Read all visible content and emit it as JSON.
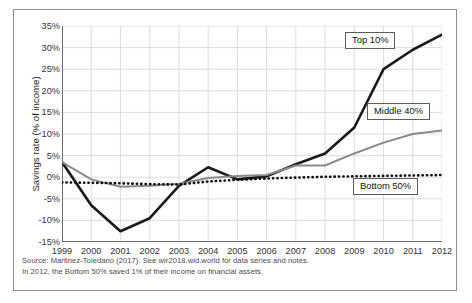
{
  "figure": {
    "frame_color": "#8d9096",
    "background": "#ffffff"
  },
  "notes": [
    "Source: Martinez-Toledano (2017). See wir2018.wid.world for data series and notes.",
    "In 2012, the Bottom 50% saved 1% of their income on financial assets."
  ],
  "callouts": {
    "top": "Top 10%",
    "middle": "Middle 40%",
    "bottom": "Bottom 50%"
  },
  "chart_data": {
    "type": "line",
    "title": "",
    "xlabel": "",
    "ylabel": "Savings rate (% of income)",
    "x": [
      1999,
      2000,
      2001,
      2002,
      2003,
      2004,
      2005,
      2006,
      2007,
      2008,
      2009,
      2010,
      2011,
      2012
    ],
    "xtick_labels": [
      "1999",
      "2000",
      "2001",
      "2002",
      "2003",
      "2004",
      "2005",
      "2006",
      "2007",
      "2008",
      "2009",
      "2010",
      "2011",
      "2012"
    ],
    "ylim": [
      -15,
      35
    ],
    "ytick_values": [
      35,
      30,
      25,
      20,
      15,
      10,
      5,
      0,
      -5,
      -10,
      -15
    ],
    "ytick_labels": [
      "35%",
      "30%",
      "25%",
      "20%",
      "15%",
      "10%",
      "5%",
      "0%",
      "-5%",
      "-10%",
      "-15%"
    ],
    "grid": true,
    "legend": "inline-callout-boxes",
    "series": [
      {
        "name": "Top 10%",
        "color": "#1a1a1a",
        "style": "solid",
        "width": 2.6,
        "values": [
          3.5,
          -6.5,
          -12.5,
          -9.5,
          -2.0,
          2.3,
          -0.5,
          0.2,
          3.0,
          5.5,
          11.5,
          25.0,
          29.5,
          33.0
        ]
      },
      {
        "name": "Middle 40%",
        "color": "#8a8a8a",
        "style": "solid",
        "width": 2.0,
        "values": [
          3.5,
          -0.5,
          -2.2,
          -2.0,
          -1.5,
          -0.2,
          0.3,
          0.5,
          2.7,
          2.7,
          5.5,
          8.0,
          10.0,
          10.8
        ]
      },
      {
        "name": "Bottom 50%",
        "color": "#111111",
        "style": "dotted",
        "width": 2.6,
        "values": [
          -1.2,
          -1.3,
          -1.4,
          -1.6,
          -1.7,
          -1.0,
          -0.6,
          -0.3,
          -0.1,
          0.1,
          0.2,
          0.3,
          0.4,
          0.5
        ]
      }
    ]
  }
}
